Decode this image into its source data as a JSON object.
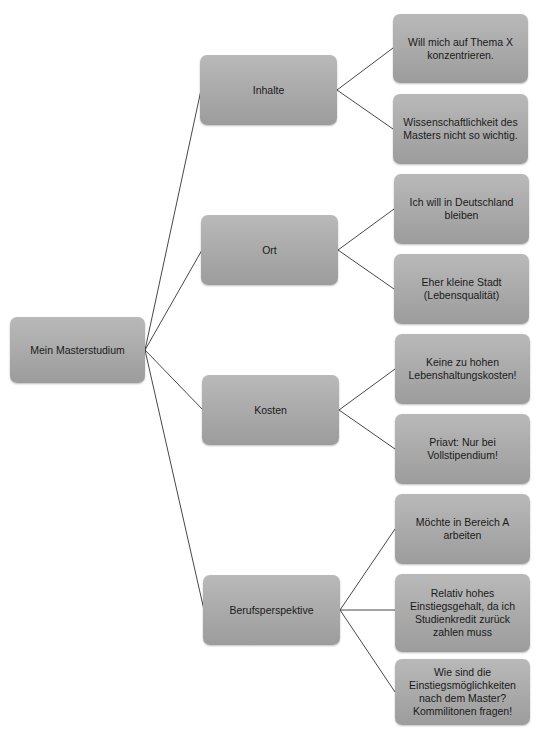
{
  "diagram": {
    "type": "mind-map",
    "root": {
      "label": "Mein Masterstudium"
    },
    "branches": [
      {
        "label": "Inhalte",
        "leaves": [
          "Will mich auf Thema X konzentrieren.",
          "Wissenschaftlichkeit des Masters nicht so wichtig."
        ]
      },
      {
        "label": "Ort",
        "leaves": [
          "Ich will in Deutschland bleiben",
          "Eher kleine Stadt (Lebensqualität)"
        ]
      },
      {
        "label": "Kosten",
        "leaves": [
          "Keine zu hohen Lebenshaltungskosten!",
          "Priavt: Nur bei Vollstipendium!"
        ]
      },
      {
        "label": "Berufsperspektive",
        "leaves": [
          "Möchte in Bereich A arbeiten",
          "Relativ hohes Einstiegsgehalt, da ich Studienkredit zurück zahlen muss",
          "Wie sind die Einstiegsmöglichkeiten nach dem Master? Kommilitonen fragen!"
        ]
      }
    ],
    "colors": {
      "node_fill": "#aaaaaa",
      "connector": "#333333",
      "text": "#1a1a1a"
    }
  }
}
